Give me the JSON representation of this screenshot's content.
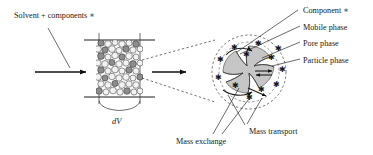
{
  "figure": {
    "title_text": "Chromatographic column mass transfer schematic",
    "background": "#ffffff",
    "ink_color": "#1a1a1a",
    "particle_fill": "#c6c6c6",
    "bead_fill": "#f2f2f2"
  },
  "labels": {
    "inlet": "Solvent + components ∗",
    "volume_element": "dV",
    "component": "Component ∗",
    "mobile_phase": "Mobile phase",
    "pore_phase": "Pore phase",
    "particle_phase": "Particle phase",
    "mass_exchange": "Mass exchange",
    "mass_transport": "Mass transport"
  },
  "callouts": [
    {
      "id": "component",
      "label": "Component ∗",
      "x": 300,
      "y": 12
    },
    {
      "id": "mobile-phase",
      "label": "Mobile phase",
      "x": 303,
      "y": 29
    },
    {
      "id": "pore-phase",
      "label": "Pore phase",
      "x": 303,
      "y": 45
    },
    {
      "id": "particle-phase",
      "label": "Particle phase",
      "x": 303,
      "y": 62
    }
  ],
  "bottom_callouts": [
    {
      "id": "mass-exchange",
      "label": "Mass exchange",
      "x": 176,
      "y": 143
    },
    {
      "id": "mass-transport",
      "label": "Mass transport",
      "x": 249,
      "y": 133
    }
  ],
  "column": {
    "x": 96,
    "y": 38,
    "width": 47,
    "height": 60,
    "label": "dV",
    "bead_count": 46
  },
  "magnifier": {
    "center_x": 249,
    "center_y": 72,
    "radius": 37,
    "star_count": 12
  },
  "arrows": {
    "inlet_arrow": "right",
    "outlet_arrow": "right"
  },
  "icons": {
    "star": "star-glyph",
    "arrow": "arrow-right-icon",
    "brace": "curly-brace"
  }
}
